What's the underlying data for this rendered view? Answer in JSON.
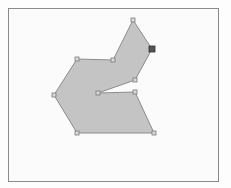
{
  "canvas": {
    "frame": {
      "x": 8,
      "y": 8,
      "width": 211,
      "height": 174,
      "border_color": "#8a8a8a"
    },
    "background": "#fbfbfb"
  },
  "polygon": {
    "fill": "#c4c4c4",
    "stroke": "#8c8c8c",
    "stroke_width": 1,
    "vertices": [
      {
        "id": "v1",
        "x": 133,
        "y": 20,
        "selected": false
      },
      {
        "id": "v2",
        "x": 152,
        "y": 49,
        "selected": true
      },
      {
        "id": "v3",
        "x": 135,
        "y": 80,
        "selected": false
      },
      {
        "id": "v4",
        "x": 98,
        "y": 93,
        "selected": false
      },
      {
        "id": "v5",
        "x": 135,
        "y": 92,
        "selected": false
      },
      {
        "id": "v6",
        "x": 154,
        "y": 133,
        "selected": false
      },
      {
        "id": "v7",
        "x": 77,
        "y": 133,
        "selected": false
      },
      {
        "id": "v8",
        "x": 54,
        "y": 95,
        "selected": false
      },
      {
        "id": "v9",
        "x": 77,
        "y": 59,
        "selected": false
      },
      {
        "id": "v10",
        "x": 113,
        "y": 60,
        "selected": false
      }
    ]
  },
  "handles": {
    "size": 4,
    "fill": "#d8d8d8",
    "stroke": "#7a7a7a",
    "selected_fill": "#555555",
    "selected_stroke": "#333333",
    "selected_size": 6
  }
}
